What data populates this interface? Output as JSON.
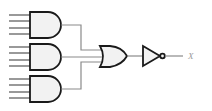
{
  "diagram": {
    "type": "logic-circuit",
    "gates": [
      {
        "id": "and1",
        "kind": "AND",
        "inputs": 4
      },
      {
        "id": "and2",
        "kind": "AND",
        "inputs": 4
      },
      {
        "id": "and3",
        "kind": "AND",
        "inputs": 4
      },
      {
        "id": "or1",
        "kind": "OR",
        "inputs": 3
      },
      {
        "id": "not1",
        "kind": "NOT",
        "inputs": 1
      }
    ],
    "output_label": "X"
  }
}
